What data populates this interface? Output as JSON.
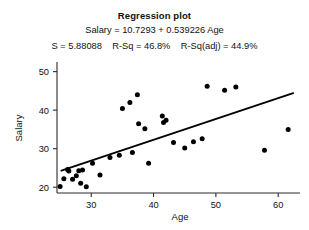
{
  "header": {
    "title": "Regression plot",
    "equation": "Salary = 10.7293 + 0.539226 Age",
    "stats": "S = 5.88088    R-Sq = 46.8%    R-Sq(adj) = 44.9%"
  },
  "chart_data": {
    "type": "scatter",
    "title": "Regression plot",
    "subtitle": "Salary = 10.7293 + 0.539226 Age",
    "annotations": [
      "S = 5.88088",
      "R-Sq = 46.8%",
      "R-Sq(adj) = 44.9%"
    ],
    "xlabel": "Age",
    "ylabel": "Salary",
    "xlim": [
      24.5,
      63.5
    ],
    "ylim": [
      18.5,
      52.5
    ],
    "xticks": [
      30,
      40,
      50,
      60
    ],
    "yticks": [
      20,
      30,
      40,
      50
    ],
    "grid": false,
    "legend": false,
    "fit": {
      "type": "linear",
      "intercept": 10.7293,
      "slope": 0.539226,
      "x_start": 25.2,
      "x_end": 62.4,
      "y_start": 24.3,
      "y_end": 44.4,
      "s": 5.88088,
      "r_sq": 46.8,
      "r_sq_adj": 44.9
    },
    "points": [
      [
        25.0,
        20.2
      ],
      [
        25.6,
        22.2
      ],
      [
        26.2,
        24.6
      ],
      [
        26.4,
        24.2
      ],
      [
        27.0,
        22.1
      ],
      [
        27.6,
        23.0
      ],
      [
        28.0,
        24.3
      ],
      [
        28.3,
        21.0
      ],
      [
        28.6,
        24.5
      ],
      [
        29.2,
        20.1
      ],
      [
        30.2,
        26.2
      ],
      [
        31.4,
        23.2
      ],
      [
        33.0,
        27.7
      ],
      [
        34.5,
        28.3
      ],
      [
        35.0,
        40.4
      ],
      [
        36.2,
        42.0
      ],
      [
        36.6,
        29.0
      ],
      [
        37.4,
        44.0
      ],
      [
        37.6,
        36.5
      ],
      [
        38.6,
        35.2
      ],
      [
        39.2,
        26.2
      ],
      [
        41.4,
        38.5
      ],
      [
        41.6,
        36.8
      ],
      [
        42.0,
        37.4
      ],
      [
        43.2,
        31.6
      ],
      [
        45.0,
        30.2
      ],
      [
        46.4,
        31.8
      ],
      [
        47.8,
        32.6
      ],
      [
        48.6,
        46.2
      ],
      [
        51.4,
        45.2
      ],
      [
        53.2,
        46.0
      ],
      [
        57.8,
        29.6
      ],
      [
        61.6,
        35.0
      ]
    ]
  }
}
